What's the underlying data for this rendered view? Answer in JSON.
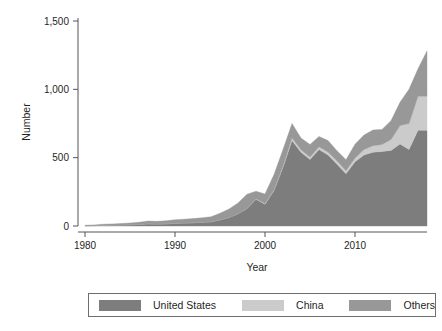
{
  "chart_data": {
    "type": "area",
    "stacked": true,
    "title": "",
    "xlabel": "Year",
    "ylabel": "Number",
    "xlim": [
      1980,
      2018
    ],
    "ylim": [
      0,
      1500
    ],
    "xticks": [
      1980,
      1990,
      2000,
      2010
    ],
    "xtick_labels": [
      "1980",
      "1990",
      "2000",
      "2010"
    ],
    "yticks": [
      0,
      500,
      1000,
      1500
    ],
    "ytick_labels": [
      "0",
      "500",
      "1,000",
      "1,500"
    ],
    "grid": false,
    "legend_position": "bottom",
    "x": [
      1980,
      1981,
      1982,
      1983,
      1984,
      1985,
      1986,
      1987,
      1988,
      1989,
      1990,
      1991,
      1992,
      1993,
      1994,
      1995,
      1996,
      1997,
      1998,
      1999,
      2000,
      2001,
      2002,
      2003,
      2004,
      2005,
      2006,
      2007,
      2008,
      2009,
      2010,
      2011,
      2012,
      2013,
      2014,
      2015,
      2016,
      2017,
      2018
    ],
    "series": [
      {
        "name": "United States",
        "color": "#7d7d7d",
        "values": [
          2,
          3,
          5,
          6,
          7,
          9,
          11,
          16,
          14,
          16,
          20,
          22,
          24,
          27,
          31,
          45,
          62,
          90,
          128,
          196,
          160,
          260,
          430,
          625,
          540,
          487,
          560,
          520,
          452,
          383,
          470,
          520,
          540,
          545,
          553,
          600,
          560,
          700,
          700
        ]
      },
      {
        "name": "China",
        "color": "#cbcbcb",
        "values": [
          0,
          0,
          0,
          0,
          0,
          0,
          0,
          0,
          0,
          0,
          0,
          0,
          0,
          0,
          0,
          0,
          0,
          0,
          2,
          3,
          4,
          6,
          10,
          20,
          18,
          17,
          20,
          22,
          25,
          22,
          28,
          40,
          48,
          52,
          80,
          135,
          190,
          250,
          250
        ]
      },
      {
        "name": "Others",
        "color": "#989898",
        "values": [
          3,
          5,
          8,
          9,
          11,
          13,
          16,
          20,
          20,
          22,
          26,
          28,
          30,
          33,
          36,
          48,
          62,
          78,
          103,
          55,
          70,
          110,
          120,
          105,
          85,
          92,
          75,
          83,
          73,
          80,
          100,
          105,
          115,
          110,
          138,
          170,
          250,
          200,
          330
        ]
      }
    ],
    "totals": [
      5,
      8,
      13,
      15,
      18,
      22,
      27,
      36,
      34,
      38,
      46,
      50,
      54,
      60,
      67,
      93,
      124,
      168,
      233,
      254,
      234,
      376,
      560,
      750,
      643,
      596,
      655,
      625,
      550,
      485,
      598,
      665,
      703,
      707,
      771,
      905,
      1000,
      1150,
      1280
    ]
  },
  "axes": {
    "ylabel": "Number",
    "xlabel": "Year"
  },
  "legend": {
    "items": [
      {
        "label": "United States",
        "color": "#7d7d7d"
      },
      {
        "label": "China",
        "color": "#cbcbcb"
      },
      {
        "label": "Others",
        "color": "#989898"
      }
    ]
  }
}
